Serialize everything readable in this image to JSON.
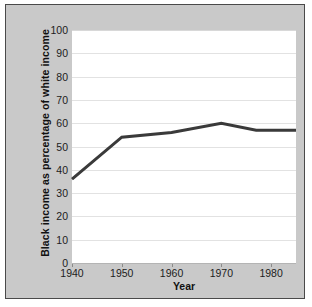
{
  "figure": {
    "background_color": "#ffffff",
    "panel_color": "#c9c9c9",
    "plot_background": "#ffffff",
    "border_color": "#4a4a4a"
  },
  "chart_data": {
    "type": "line",
    "title": "",
    "xlabel": "Year",
    "ylabel": "Black income as  percentage of white income",
    "xlim": [
      1940,
      1985
    ],
    "ylim": [
      0,
      100
    ],
    "grid": true,
    "legend": "none",
    "line_color": "#3a3a3a",
    "line_width": 3,
    "xticks": [
      1940,
      1950,
      1960,
      1970,
      1980
    ],
    "xtick_labels": [
      "1940",
      "1950",
      "1960",
      "1970",
      "1980"
    ],
    "yticks": [
      0,
      10,
      20,
      30,
      40,
      50,
      60,
      70,
      80,
      90,
      100
    ],
    "ytick_labels": [
      "0",
      "10",
      "20",
      "30",
      "40",
      "50",
      "60",
      "70",
      "80",
      "90",
      "100"
    ],
    "x": [
      1940,
      1950,
      1960,
      1970,
      1977,
      1985
    ],
    "values": [
      36,
      54,
      56,
      60,
      57,
      57
    ],
    "series": [
      {
        "name": "Black income as percentage of white income",
        "x": [
          1940,
          1950,
          1960,
          1970,
          1977,
          1985
        ],
        "values": [
          36,
          54,
          56,
          60,
          57,
          57
        ]
      }
    ]
  }
}
